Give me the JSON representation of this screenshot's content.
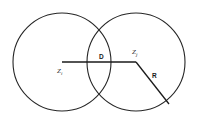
{
  "diagram": {
    "type": "two-overlapping-circles-venn",
    "background_color": "#ffffff",
    "stroke_color": "#262626",
    "label_color": "#1a1a1a",
    "circles": [
      {
        "name": "left-circle",
        "cx": 62,
        "cy": 62,
        "r": 49
      },
      {
        "name": "right-circle",
        "cx": 136,
        "cy": 62,
        "r": 49
      }
    ],
    "segments": [
      {
        "name": "center-distance-line",
        "x1": 62,
        "y1": 62,
        "x2": 136,
        "y2": 62
      },
      {
        "name": "radius-line",
        "x1": 136,
        "y1": 62,
        "x2": 169,
        "y2": 104
      }
    ],
    "labels": {
      "left_center": {
        "text": "Z",
        "subscript": "i"
      },
      "right_center": {
        "text": "Z",
        "subscript": "j"
      },
      "distance": "D",
      "radius": "R"
    }
  }
}
